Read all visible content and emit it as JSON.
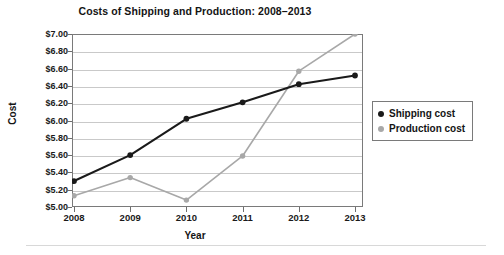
{
  "chart_data": {
    "type": "line",
    "title": "Costs of Shipping and Production: 2008–2013",
    "xlabel": "Year",
    "ylabel": "Cost",
    "categories": [
      "2008",
      "2009",
      "2010",
      "2011",
      "2012",
      "2013"
    ],
    "x": [
      2008,
      2009,
      2010,
      2011,
      2012,
      2013
    ],
    "series": [
      {
        "name": "Shipping cost",
        "color": "#1a1a1a",
        "marker": "circle",
        "values": [
          5.3,
          5.6,
          6.02,
          6.21,
          6.42,
          6.52
        ]
      },
      {
        "name": "Production cost",
        "color": "#a8a8a8",
        "marker": "circle",
        "values": [
          5.13,
          5.34,
          5.08,
          5.59,
          6.57,
          7.0
        ]
      }
    ],
    "ylim": [
      5.0,
      7.0
    ],
    "ytick_step": 0.2,
    "ytick_labels": [
      "$7.00",
      "$6.80",
      "$6.60",
      "$6.40",
      "$6.20",
      "$6.00",
      "$5.80",
      "$5.60",
      "$5.40",
      "$5.20",
      "$5.00"
    ],
    "ytick_values": [
      7.0,
      6.8,
      6.6,
      6.4,
      6.2,
      6.0,
      5.8,
      5.6,
      5.4,
      5.2,
      5.0
    ],
    "grid": true,
    "legend_position": "right",
    "legend_entries": [
      "Shipping cost",
      "Production cost"
    ]
  },
  "legend": {
    "items": [
      {
        "label": "Shipping cost",
        "color": "#1a1a1a"
      },
      {
        "label": "Production cost",
        "color": "#a8a8a8"
      }
    ]
  }
}
